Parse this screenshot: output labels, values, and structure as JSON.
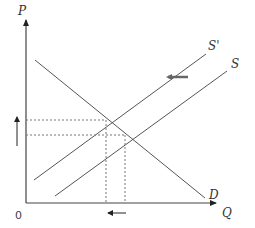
{
  "top_cut_text": "",
  "axes": {
    "y_label": "P",
    "x_label": "Q",
    "origin_label": "0"
  },
  "curves": {
    "demand_label": "D",
    "supply_label": "S",
    "supply_shifted_label": "S'"
  },
  "colors": {
    "line": "#555555",
    "axis": "#444444",
    "dashed": "#777777",
    "shift_arrow": "#666666"
  },
  "annotations": {
    "supply_shift": "left",
    "price_change": "up",
    "quantity_change": "left"
  }
}
